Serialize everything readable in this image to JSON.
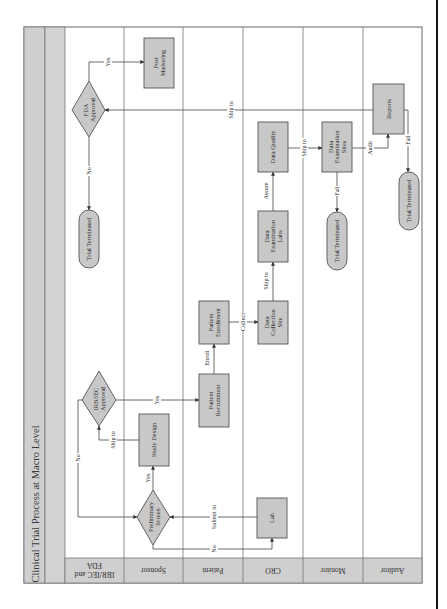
{
  "title": "Clinical Trial Process at Macro Level",
  "colors": {
    "header_fill": "#cfcfcf",
    "node_fill": "#c8c8c8",
    "node_stroke": "#555555",
    "line": "#444444",
    "frame": "#666666"
  },
  "lanes": [
    {
      "id": "irb",
      "label_line1": "IBR/IEC and",
      "label_line2": "FDA"
    },
    {
      "id": "sponsor",
      "label": "Sponsor"
    },
    {
      "id": "patient",
      "label": "Patient"
    },
    {
      "id": "cro",
      "label": "CRO"
    },
    {
      "id": "monitor",
      "label": "Monitor"
    },
    {
      "id": "auditor",
      "label": "Auditor"
    }
  ],
  "nodes": {
    "fda_approval": {
      "line1": "FDA",
      "line2": "Approval",
      "shape": "diamond",
      "lane": "irb"
    },
    "post_marketing": {
      "line1": "Post",
      "line2": "Marketing",
      "shape": "box",
      "lane": "sponsor"
    },
    "trial_terminated_fda": {
      "text": "Trial Terminated",
      "shape": "terminal",
      "lane": "irb"
    },
    "irb_approval": {
      "line1": "IRB/IEC",
      "line2": "Approval",
      "shape": "diamond",
      "lane": "irb"
    },
    "study_design": {
      "text": "Study Design",
      "shape": "box",
      "lane": "sponsor"
    },
    "preliminary_screen": {
      "line1": "Preliminary",
      "line2": "Screen",
      "shape": "diamond",
      "lane": "sponsor"
    },
    "patient_recruitment": {
      "line1": "Patient",
      "line2": "Recruitment",
      "shape": "box",
      "lane": "patient"
    },
    "patient_enrollment": {
      "line1": "Patient",
      "line2": "Enrollment",
      "shape": "box",
      "lane": "patient"
    },
    "data_collection_site": {
      "line1": "Data",
      "line2": "Collection",
      "line3": "Site",
      "shape": "box",
      "lane": "cro"
    },
    "data_examination_labs": {
      "line1": "Data",
      "line2": "Examination",
      "line3": "Labs",
      "shape": "box",
      "lane": "cro"
    },
    "data_quality": {
      "text": "Data Quality",
      "shape": "box",
      "lane": "cro"
    },
    "lab": {
      "text": "Lab",
      "shape": "box",
      "lane": "cro"
    },
    "data_examination_sites": {
      "line1": "Data",
      "line2": "Examination",
      "line3": "Sites",
      "shape": "box",
      "lane": "monitor"
    },
    "trial_terminated_monitor": {
      "text": "Trial Terminated",
      "shape": "terminal",
      "lane": "monitor"
    },
    "reports": {
      "text": "Reports",
      "shape": "box",
      "lane": "auditor"
    },
    "trial_terminated_auditor": {
      "text": "Trial Terminated",
      "shape": "terminal",
      "lane": "auditor"
    }
  },
  "edges": {
    "fda_yes": "Yes",
    "fda_no": "No",
    "reports_ship_to": "Ship to",
    "reports_fail": "Fail",
    "irb_yes": "Yes",
    "irb_no": "No",
    "study_ship_to": "Ship to",
    "prelim_yes": "Yes",
    "lab_submit_to": "Submit to",
    "prelim_no": "No",
    "enroll": "Enroll",
    "collect": "Collect",
    "dcs_ship_to": "Ship to",
    "assure": "Assure",
    "dq_ship_to": "Ship to",
    "des_fail": "Fail",
    "audit": "Audit"
  }
}
